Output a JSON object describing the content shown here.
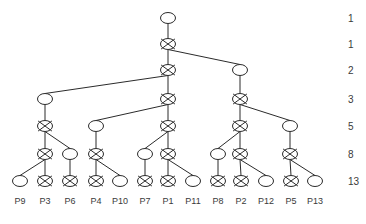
{
  "figure": {
    "kind": "dendrogram",
    "background_color": "#ffffff",
    "line_color": "#2b2b2b",
    "text_color": "#3a3a3a",
    "node_fill": "#ffffff",
    "node_rx": 7.5,
    "node_ry": 5.5
  },
  "levels": [
    {
      "y": 18,
      "count_label": "1"
    },
    {
      "y": 44,
      "count_label": "1"
    },
    {
      "y": 70,
      "count_label": "2"
    },
    {
      "y": 99,
      "count_label": "3"
    },
    {
      "y": 126,
      "count_label": "5"
    },
    {
      "y": 154,
      "count_label": "8"
    },
    {
      "y": 181,
      "count_label": "13"
    }
  ],
  "count_column": {
    "x": 348,
    "labels": [
      "1",
      "1",
      "2",
      "3",
      "5",
      "8",
      "13"
    ]
  },
  "nodes": [
    {
      "id": "n0",
      "x": 168,
      "y": 18,
      "type": "open"
    },
    {
      "id": "n1",
      "x": 168,
      "y": 44,
      "type": "crossed"
    },
    {
      "id": "n2",
      "x": 168,
      "y": 70,
      "type": "crossed"
    },
    {
      "id": "n3",
      "x": 240,
      "y": 70,
      "type": "open"
    },
    {
      "id": "n4",
      "x": 45,
      "y": 99,
      "type": "open"
    },
    {
      "id": "n5",
      "x": 168,
      "y": 99,
      "type": "crossed"
    },
    {
      "id": "n6",
      "x": 240,
      "y": 99,
      "type": "crossed"
    },
    {
      "id": "n7",
      "x": 45,
      "y": 126,
      "type": "crossed"
    },
    {
      "id": "n8",
      "x": 96,
      "y": 126,
      "type": "open"
    },
    {
      "id": "n9",
      "x": 168,
      "y": 126,
      "type": "crossed"
    },
    {
      "id": "n10",
      "x": 240,
      "y": 126,
      "type": "crossed"
    },
    {
      "id": "n11",
      "x": 290,
      "y": 126,
      "type": "open"
    },
    {
      "id": "n12",
      "x": 45,
      "y": 154,
      "type": "crossed"
    },
    {
      "id": "n13",
      "x": 70,
      "y": 154,
      "type": "open"
    },
    {
      "id": "n14",
      "x": 96,
      "y": 154,
      "type": "crossed"
    },
    {
      "id": "n15",
      "x": 145,
      "y": 154,
      "type": "open"
    },
    {
      "id": "n16",
      "x": 168,
      "y": 154,
      "type": "crossed"
    },
    {
      "id": "n17",
      "x": 218,
      "y": 154,
      "type": "open"
    },
    {
      "id": "n18",
      "x": 240,
      "y": 154,
      "type": "crossed"
    },
    {
      "id": "n19",
      "x": 290,
      "y": 154,
      "type": "crossed"
    },
    {
      "id": "l0",
      "x": 20,
      "y": 181,
      "type": "open",
      "label": "P9"
    },
    {
      "id": "l1",
      "x": 45,
      "y": 181,
      "type": "crossed",
      "label": "P3"
    },
    {
      "id": "l2",
      "x": 70,
      "y": 181,
      "type": "crossed",
      "label": "P6"
    },
    {
      "id": "l3",
      "x": 96,
      "y": 181,
      "type": "crossed",
      "label": "P4"
    },
    {
      "id": "l4",
      "x": 120,
      "y": 181,
      "type": "open",
      "label": "P10"
    },
    {
      "id": "l5",
      "x": 145,
      "y": 181,
      "type": "crossed",
      "label": "P7"
    },
    {
      "id": "l6",
      "x": 168,
      "y": 181,
      "type": "crossed",
      "label": "P1"
    },
    {
      "id": "l7",
      "x": 193,
      "y": 181,
      "type": "open",
      "label": "P11"
    },
    {
      "id": "l8",
      "x": 218,
      "y": 181,
      "type": "crossed",
      "label": "P8"
    },
    {
      "id": "l9",
      "x": 241,
      "y": 181,
      "type": "crossed",
      "label": "P2"
    },
    {
      "id": "l10",
      "x": 266,
      "y": 181,
      "type": "open",
      "label": "P12"
    },
    {
      "id": "l11",
      "x": 291,
      "y": 181,
      "type": "crossed",
      "label": "P5"
    },
    {
      "id": "l12",
      "x": 315,
      "y": 181,
      "type": "open",
      "label": "P13"
    }
  ],
  "edges": [
    {
      "from": "n0",
      "to": "n1"
    },
    {
      "from": "n1",
      "to": "n2"
    },
    {
      "from": "n1",
      "to": "n3"
    },
    {
      "from": "n2",
      "to": "n4"
    },
    {
      "from": "n2",
      "to": "n5"
    },
    {
      "from": "n3",
      "to": "n6"
    },
    {
      "from": "n4",
      "to": "n7"
    },
    {
      "from": "n5",
      "to": "n8"
    },
    {
      "from": "n5",
      "to": "n9"
    },
    {
      "from": "n6",
      "to": "n10"
    },
    {
      "from": "n6",
      "to": "n11"
    },
    {
      "from": "n7",
      "to": "n12"
    },
    {
      "from": "n7",
      "to": "n13"
    },
    {
      "from": "n8",
      "to": "n14"
    },
    {
      "from": "n9",
      "to": "n15"
    },
    {
      "from": "n9",
      "to": "n16"
    },
    {
      "from": "n10",
      "to": "n17"
    },
    {
      "from": "n10",
      "to": "n18"
    },
    {
      "from": "n11",
      "to": "n19"
    },
    {
      "from": "n12",
      "to": "l0"
    },
    {
      "from": "n12",
      "to": "l1"
    },
    {
      "from": "n13",
      "to": "l2"
    },
    {
      "from": "n14",
      "to": "l3"
    },
    {
      "from": "n14",
      "to": "l4"
    },
    {
      "from": "n15",
      "to": "l5"
    },
    {
      "from": "n16",
      "to": "l6"
    },
    {
      "from": "n16",
      "to": "l7"
    },
    {
      "from": "n17",
      "to": "l8"
    },
    {
      "from": "n18",
      "to": "l9"
    },
    {
      "from": "n18",
      "to": "l10"
    },
    {
      "from": "n19",
      "to": "l11"
    },
    {
      "from": "n19",
      "to": "l12"
    }
  ],
  "leaf_labels": [
    "P9",
    "P3",
    "P6",
    "P4",
    "P10",
    "P7",
    "P1",
    "P11",
    "P8",
    "P2",
    "P12",
    "P5",
    "P13"
  ],
  "leaf_label_y": 204,
  "chart_data": {
    "type": "diagram",
    "title": "",
    "xlabel": "",
    "ylabel": "",
    "cluster_sizes": [
      1,
      1,
      2,
      3,
      5,
      8,
      13
    ],
    "leaves": [
      "P9",
      "P3",
      "P6",
      "P4",
      "P10",
      "P7",
      "P1",
      "P11",
      "P8",
      "P2",
      "P12",
      "P5",
      "P13"
    ],
    "legend": []
  }
}
